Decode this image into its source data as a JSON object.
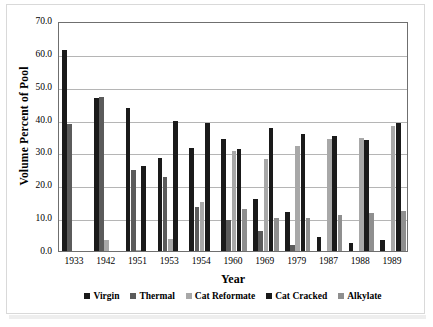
{
  "chart_data": {
    "type": "bar",
    "title": "",
    "xlabel": "Year",
    "ylabel": "Volume Percent of Pool",
    "categories": [
      "1933",
      "1942",
      "1951",
      "1953",
      "1954",
      "1960",
      "1969",
      "1979",
      "1987",
      "1988",
      "1989"
    ],
    "ylim": [
      0.0,
      70.0
    ],
    "y_ticks": [
      "0.0",
      "10.0",
      "20.0",
      "30.0",
      "40.0",
      "50.0",
      "60.0",
      "70.0"
    ],
    "y_tick_values": [
      0.0,
      10.0,
      20.0,
      30.0,
      40.0,
      50.0,
      60.0,
      70.0
    ],
    "grid": true,
    "legend_position": "bottom",
    "series": [
      {
        "name": "Virgin",
        "color": "#1a1a1a",
        "values": [
          61.3,
          46.5,
          43.5,
          28.3,
          31.3,
          34.2,
          15.9,
          12.0,
          4.4,
          2.5,
          3.3
        ]
      },
      {
        "name": "Thermal",
        "color": "#5b5b5b",
        "values": [
          38.8,
          47.0,
          24.7,
          22.4,
          13.5,
          9.4,
          6.0,
          1.9,
          0.0,
          0.0,
          0.0
        ]
      },
      {
        "name": "Cat Reformate",
        "color": "#a8a8a8",
        "values": [
          0.0,
          3.5,
          0.4,
          3.6,
          15.0,
          30.5,
          27.9,
          32.1,
          34.2,
          34.3,
          38.1
        ]
      },
      {
        "name": "Cat Cracked",
        "color": "#1a1a1a",
        "values": [
          0.0,
          0.0,
          25.8,
          39.6,
          39.0,
          30.9,
          37.3,
          35.6,
          35.0,
          33.9,
          38.9
        ]
      },
      {
        "name": "Alkylate",
        "color": "#8f8f8f",
        "values": [
          0.0,
          0.0,
          0.0,
          0.0,
          0.0,
          12.8,
          9.9,
          10.1,
          11.1,
          11.6,
          12.2
        ]
      }
    ]
  }
}
